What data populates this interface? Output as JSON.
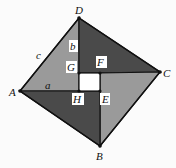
{
  "diagram": {
    "type": "geometry",
    "colors": {
      "light_triangle": "#9a9a9a",
      "dark_triangle": "#4a4a4a",
      "center_square": "#ffffff",
      "edge": "#111111"
    },
    "points": {
      "A": {
        "label": "A",
        "x": 20,
        "y": 91
      },
      "B": {
        "label": "B",
        "x": 100,
        "y": 146
      },
      "C": {
        "label": "C",
        "x": 160,
        "y": 72
      },
      "D": {
        "label": "D",
        "x": 79,
        "y": 18
      },
      "E": {
        "label": "E",
        "x": 100,
        "y": 91
      },
      "F": {
        "label": "F",
        "x": 100,
        "y": 73
      },
      "G": {
        "label": "G",
        "x": 79,
        "y": 73
      },
      "H": {
        "label": "H",
        "x": 79,
        "y": 91
      }
    },
    "segment_labels": {
      "c": "c",
      "b": "b",
      "a": "a"
    }
  }
}
